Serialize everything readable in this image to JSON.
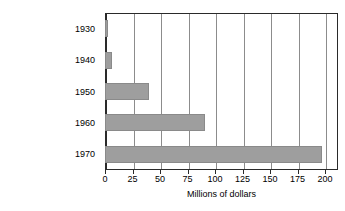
{
  "chart_data": {
    "type": "bar",
    "orientation": "horizontal",
    "title": "",
    "xlabel": "Millions of dollars",
    "ylabel": "",
    "categories": [
      "1930",
      "1940",
      "1950",
      "1960",
      "1970"
    ],
    "values": [
      3,
      6,
      40,
      91,
      197
    ],
    "xlim": [
      0,
      200
    ],
    "xticks": [
      0,
      25,
      50,
      75,
      100,
      125,
      150,
      175,
      200
    ],
    "xtick_labels": [
      "0",
      "25",
      "50",
      "75",
      "100",
      "125",
      "150",
      "175",
      "200"
    ],
    "grid": "vertical",
    "legend": null,
    "series": [
      {
        "name": "",
        "values": [
          3,
          6,
          40,
          91,
          197
        ]
      }
    ],
    "colors": {
      "bar_fill": "#9e9e9e",
      "bar_stroke": "#8a8a8a",
      "axis": "#2a2a2a",
      "gridline": "#8c8c8c",
      "text": "#000000",
      "background": "#ffffff"
    }
  }
}
